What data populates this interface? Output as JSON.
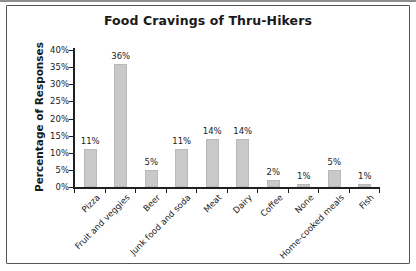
{
  "chart_data": {
    "type": "bar",
    "title": "Food Cravings of Thru-Hikers",
    "xlabel": "",
    "ylabel": "Percentage of Responses",
    "categories": [
      "Pizza",
      "Fruit and veggies",
      "Beer",
      "Junk food and soda",
      "Meat",
      "Dairy",
      "Coffee",
      "None",
      "Home-cooked meals",
      "Fish"
    ],
    "values": [
      11,
      36,
      5,
      11,
      14,
      14,
      2,
      1,
      5,
      1
    ],
    "bar_labels": [
      "11%",
      "36%",
      "5%",
      "11%",
      "14%",
      "14%",
      "2%",
      "1%",
      "5%",
      "1%"
    ],
    "ytick_labels": [
      "0%",
      "5%",
      "10%",
      "15%",
      "20%",
      "25%",
      "30%",
      "35%",
      "40%"
    ],
    "ylim": [
      0,
      40
    ],
    "ytick_step": 5,
    "grid": false,
    "legend": "none",
    "bar_color": "#c9c9c9",
    "bar_edge_color": "#b9b9b9",
    "axis_color": "#1f1f1f",
    "text_color": "#1a1a1a",
    "frame_border_color": "#555555",
    "background_color": "#ffffff"
  }
}
